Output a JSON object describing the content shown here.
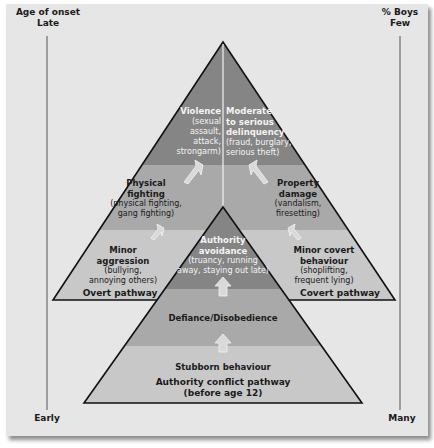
{
  "left_axis": {
    "title": "Age of onset",
    "top_label": "Late",
    "bottom_label": "Early"
  },
  "right_axis": {
    "title": "% Boys",
    "top_label": "Few",
    "bottom_label": "Many"
  },
  "overt_pathway": {
    "name": "Overt pathway",
    "stages": [
      {
        "title": "Minor aggression",
        "title_l1": "Minor",
        "title_l2": "aggression",
        "desc_l1": "(bullying,",
        "desc_l2": "annoying others)"
      },
      {
        "title": "Physical fighting",
        "title_l1": "Physical",
        "title_l2": "fighting",
        "desc_l1": "(physical fighting,",
        "desc_l2": "gang fighting)"
      },
      {
        "title": "Violence",
        "title_l1": "Violence",
        "desc_l1": "(sexual",
        "desc_l2": "assault, attack,",
        "desc_l3": "strongarm)"
      }
    ]
  },
  "covert_pathway": {
    "name": "Covert pathway",
    "stages": [
      {
        "title": "Minor covert behaviour",
        "title_l1": "Minor covert",
        "title_l2": "behaviour",
        "desc_l1": "(shoplifting,",
        "desc_l2": "frequent lying)"
      },
      {
        "title": "Property damage",
        "title_l1": "Property",
        "title_l2": "damage",
        "desc_l1": "(vandalism,",
        "desc_l2": "firesetting)"
      },
      {
        "title": "Moderate to serious delinquency",
        "title_l1": "Moderate",
        "title_l2": "to serious",
        "title_l3": "delinquency",
        "desc_l1": "(fraud, burglary,",
        "desc_l2": "serious theft)"
      }
    ]
  },
  "authority_conflict_pathway": {
    "name_l1": "Authority conflict pathway",
    "name_l2": "(before age 12)",
    "stages": [
      {
        "title": "Stubborn behaviour"
      },
      {
        "title": "Defiance/Disobedience"
      },
      {
        "title": "Authority avoidance",
        "title_l1": "Authority",
        "title_l2": "avoidance",
        "desc_l1": "(truancy, running",
        "desc_l2": "away, staying out late)"
      }
    ]
  },
  "colors": {
    "background": "#e6e6e6",
    "band_light": "#c8c8c8",
    "band_mid": "#a9a9a9",
    "band_dark": "#858585",
    "outline": "#111111"
  }
}
